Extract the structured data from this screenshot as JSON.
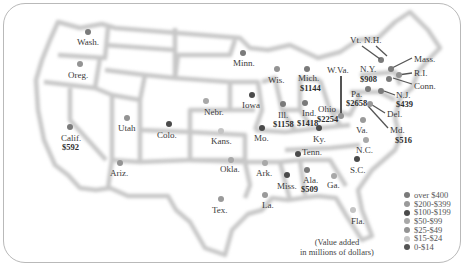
{
  "map": {
    "title": "",
    "note_line1": "(Value added",
    "note_line2": "in millions of dollars)",
    "legend": [
      {
        "label": "over $400",
        "color": "#7a7a7a"
      },
      {
        "label": "$200-$399",
        "color": "#9a9a9a"
      },
      {
        "label": "$100-$199",
        "color": "#4a4a4a"
      },
      {
        "label": "$50-$99",
        "color": "#a8a8a8"
      },
      {
        "label": "$25-$49",
        "color": "#939393"
      },
      {
        "label": "$15-$24",
        "color": "#c4c4c4"
      },
      {
        "label": "0-$14",
        "color": "#555555"
      }
    ],
    "states": [
      {
        "name": "Wash.",
        "value": ""
      },
      {
        "name": "Oreg.",
        "value": ""
      },
      {
        "name": "Calif.",
        "value": "$592"
      },
      {
        "name": "Utah",
        "value": ""
      },
      {
        "name": "Ariz.",
        "value": ""
      },
      {
        "name": "Colo.",
        "value": ""
      },
      {
        "name": "Nebr.",
        "value": ""
      },
      {
        "name": "Kans.",
        "value": ""
      },
      {
        "name": "Okla.",
        "value": ""
      },
      {
        "name": "Tex.",
        "value": ""
      },
      {
        "name": "Minn.",
        "value": ""
      },
      {
        "name": "Iowa",
        "value": ""
      },
      {
        "name": "Mo.",
        "value": ""
      },
      {
        "name": "Ark.",
        "value": ""
      },
      {
        "name": "La.",
        "value": ""
      },
      {
        "name": "Wis.",
        "value": ""
      },
      {
        "name": "Ill.",
        "value": "$1158"
      },
      {
        "name": "Mich.",
        "value": "$1144"
      },
      {
        "name": "Ind.",
        "value": "$1418"
      },
      {
        "name": "Ohio",
        "value": "$2254"
      },
      {
        "name": "Ky.",
        "value": ""
      },
      {
        "name": "Tenn.",
        "value": ""
      },
      {
        "name": "Miss.",
        "value": ""
      },
      {
        "name": "Ala.",
        "value": "$509"
      },
      {
        "name": "Ga.",
        "value": ""
      },
      {
        "name": "Fla.",
        "value": ""
      },
      {
        "name": "S.C.",
        "value": ""
      },
      {
        "name": "N.C.",
        "value": ""
      },
      {
        "name": "Va.",
        "value": ""
      },
      {
        "name": "W.Va.",
        "value": ""
      },
      {
        "name": "Pa.",
        "value": "$2658"
      },
      {
        "name": "N.Y.",
        "value": "$908"
      },
      {
        "name": "Vt.",
        "value": ""
      },
      {
        "name": "N.H.",
        "value": ""
      },
      {
        "name": "Mass.",
        "value": ""
      },
      {
        "name": "R.I.",
        "value": ""
      },
      {
        "name": "Conn.",
        "value": ""
      },
      {
        "name": "N.J.",
        "value": "$439"
      },
      {
        "name": "Del.",
        "value": ""
      },
      {
        "name": "Md.",
        "value": "$516"
      }
    ]
  }
}
